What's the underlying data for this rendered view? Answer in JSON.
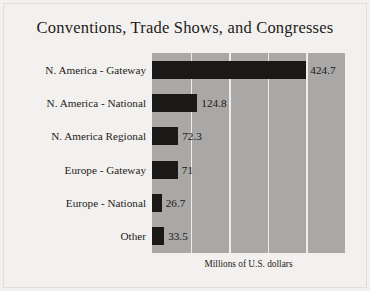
{
  "chart_data": {
    "type": "bar",
    "orientation": "horizontal",
    "title": "Conventions, Trade Shows, and Congresses",
    "xlabel": "Millions of U.S. dollars",
    "ylabel": "",
    "categories": [
      "N. America - Gateway",
      "N. America - National",
      "N. America Regional",
      "Europe - Gateway",
      "Europe - National",
      "Other"
    ],
    "values": [
      424.7,
      124.8,
      72.3,
      71,
      26.7,
      33.5
    ],
    "value_labels": [
      "424.7",
      "124.8",
      "72.3",
      "71",
      "26.7",
      "33.5"
    ],
    "xlim": [
      0,
      531
    ],
    "gridline_values": [
      106,
      212,
      319,
      425
    ],
    "grid": true,
    "legend": false,
    "colors": {
      "bar": "#1b1917",
      "plot_background": "#a9a8a6",
      "gridline": "#f0eeec",
      "page_background": "#f3f1ef",
      "text": "#1d1b19"
    }
  }
}
